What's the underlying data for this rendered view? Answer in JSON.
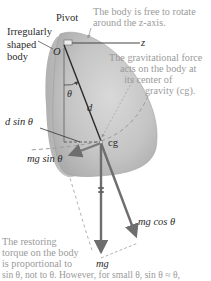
{
  "diagram": {
    "labels": {
      "pivot": "Pivot",
      "body_line1": "Irregularly",
      "body_line2": "shaped",
      "body_line3": "body",
      "origin": "O",
      "z_axis": "z",
      "theta": "θ",
      "d": "d",
      "d_sin_theta": "d sin θ",
      "cg": "cg",
      "mg_sin_theta": "mg sin θ",
      "mg_cos_theta": "mg cos θ",
      "mg": "mg"
    },
    "notes": {
      "rotation_line1": "The body is free to rotate",
      "rotation_line2": "around the z-axis.",
      "gravity_line1": "The gravitational force",
      "gravity_line2": "acts on the body at",
      "gravity_line3": "its center of",
      "gravity_line4": "gravity (cg).",
      "torque_line1": "The restoring",
      "torque_line2": "torque on the body",
      "torque_line3": "is proportional to",
      "torque_line4": "sin θ, not to θ. However, for small θ, sin θ ≈ θ,"
    },
    "colors": {
      "body_fill": "#c8c8c8",
      "body_shade": "#a9a9a9",
      "line_dark": "#333333",
      "arrow": "#6e6e6e",
      "note_text": "#9a9a9a",
      "dashed": "#9c9c9c"
    }
  }
}
